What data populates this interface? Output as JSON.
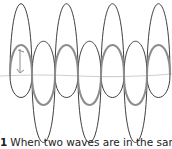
{
  "figure": {
    "colors": {
      "wave_outline": "#222222",
      "component_wave": "#8a8a8a",
      "axis_line": "#c8c8c8",
      "arrow": "#8a8a8a"
    },
    "crossings_x": [
      10,
      32,
      55,
      78,
      101,
      124,
      147,
      170
    ],
    "baseline_y": 75
  },
  "caption": {
    "number": "1",
    "text": "When two waves are in the same",
    "left_fragment": ")"
  }
}
